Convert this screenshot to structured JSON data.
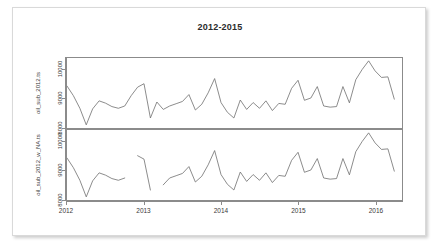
{
  "chart_data": {
    "type": "line",
    "title": "2012-2015",
    "xlabel": "",
    "ylabel": "",
    "xlim": [
      2012.0,
      2016.35
    ],
    "grid": false,
    "legend": null,
    "x_ticks": [
      "2012",
      "2013",
      "2014",
      "2015",
      "2016"
    ],
    "x_tick_values": [
      2012,
      2013,
      2014,
      2015,
      2016
    ],
    "panels": [
      {
        "name": "oil_sub_2012.ts",
        "ylabel": "oil_sub_2012.ts",
        "y_ticks": [
          "8000",
          "9000",
          "10000"
        ],
        "y_tick_values": [
          8000,
          9000,
          10000
        ],
        "ylim": [
          7950,
          10400
        ],
        "x": [
          2012.0,
          2012.083,
          2012.167,
          2012.25,
          2012.333,
          2012.417,
          2012.5,
          2012.583,
          2012.667,
          2012.75,
          2012.833,
          2012.917,
          2013.0,
          2013.083,
          2013.167,
          2013.25,
          2013.333,
          2013.417,
          2013.5,
          2013.583,
          2013.667,
          2013.75,
          2013.833,
          2013.917,
          2014.0,
          2014.083,
          2014.167,
          2014.25,
          2014.333,
          2014.417,
          2014.5,
          2014.583,
          2014.667,
          2014.75,
          2014.833,
          2014.917,
          2015.0,
          2015.083,
          2015.167,
          2015.25,
          2015.333,
          2015.417,
          2015.5,
          2015.583,
          2015.667,
          2015.75,
          2015.833,
          2015.917,
          2016.0,
          2016.083,
          2016.167,
          2016.25
        ],
        "y": [
          9420,
          9080,
          8640,
          8060,
          8620,
          8900,
          8820,
          8700,
          8640,
          8720,
          9080,
          9380,
          9500,
          8300,
          8860,
          8600,
          8720,
          8800,
          8880,
          9120,
          8580,
          8780,
          9180,
          9680,
          8840,
          8500,
          8300,
          8930,
          8600,
          8840,
          8640,
          8900,
          8560,
          8810,
          8780,
          9340,
          9620,
          8920,
          9000,
          9400,
          8720,
          8680,
          8700,
          9400,
          8830,
          9640,
          10000,
          10300,
          9950,
          9720,
          9740,
          8960
        ]
      },
      {
        "name": "oil_sub_2012_w_NA.ts",
        "ylabel": "oil_sub_2012_w_NA.ts",
        "y_ticks": [
          "8000",
          "9000",
          "10000"
        ],
        "y_tick_values": [
          8000,
          9000,
          10000
        ],
        "ylim": [
          7950,
          10400
        ],
        "note": "same series with missing (NA) values creating line gaps",
        "segments": [
          {
            "x": [
              2012.0,
              2012.083,
              2012.167,
              2012.25,
              2012.333,
              2012.417,
              2012.5,
              2012.583,
              2012.667,
              2012.75
            ],
            "y": [
              9420,
              9080,
              8640,
              8060,
              8620,
              8900,
              8820,
              8700,
              8640,
              8720
            ]
          },
          {
            "x": [
              2012.917,
              2013.0,
              2013.083
            ],
            "y": [
              9500,
              9380,
              8300
            ]
          },
          {
            "x": [
              2013.25,
              2013.333,
              2013.417,
              2013.5,
              2013.583,
              2013.667,
              2013.75,
              2013.833,
              2013.917,
              2014.0,
              2014.083,
              2014.167,
              2014.25,
              2014.333,
              2014.417,
              2014.5,
              2014.583,
              2014.667,
              2014.75,
              2014.833,
              2014.917,
              2015.0,
              2015.083,
              2015.167,
              2015.25,
              2015.333,
              2015.417,
              2015.5,
              2015.583,
              2015.667,
              2015.75,
              2015.833,
              2015.917,
              2016.0,
              2016.083,
              2016.167,
              2016.25
            ],
            "y": [
              8480,
              8720,
              8800,
              8880,
              9120,
              8580,
              8780,
              9180,
              9680,
              8840,
              8500,
              8300,
              8930,
              8600,
              8840,
              8640,
              8900,
              8560,
              8810,
              8780,
              9340,
              9620,
              8920,
              9000,
              9400,
              8720,
              8680,
              8700,
              9400,
              8830,
              9640,
              10000,
              10300,
              9950,
              9720,
              9740,
              8960
            ]
          }
        ]
      }
    ]
  }
}
